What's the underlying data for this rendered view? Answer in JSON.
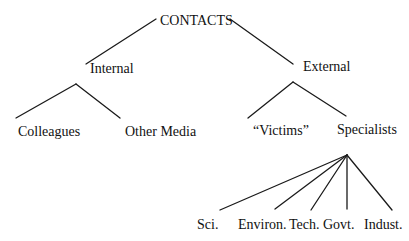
{
  "diagram": {
    "type": "tree",
    "root": {
      "label": "CONTACTS",
      "children": [
        {
          "label": "Internal",
          "children": [
            {
              "label": "Colleagues"
            },
            {
              "label": "Other Media"
            }
          ]
        },
        {
          "label": "External",
          "children": [
            {
              "label": "“Victims”"
            },
            {
              "label": "Specialists",
              "children": [
                {
                  "label": "Sci."
                },
                {
                  "label": "Environ."
                },
                {
                  "label": "Tech."
                },
                {
                  "label": "Govt."
                },
                {
                  "label": "Indust."
                }
              ]
            }
          ]
        }
      ]
    }
  },
  "nodes": {
    "root": "CONTACTS",
    "internal": "Internal",
    "external": "External",
    "colleagues": "Colleagues",
    "other_media": "Other Media",
    "victims": "“Victims”",
    "specialists": "Specialists",
    "sci": "Sci.",
    "environ": "Environ.",
    "tech": "Tech.",
    "govt": "Govt.",
    "indust": "Indust."
  },
  "colors": {
    "line": "#1a1a1a",
    "text": "#111111",
    "background": "#ffffff"
  }
}
